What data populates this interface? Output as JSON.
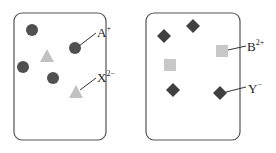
{
  "diagram": {
    "colors": {
      "dark_particle": "#505050",
      "light_particle": "#c2c2c2",
      "border": "#555555",
      "text": "#222222"
    },
    "panels": [
      {
        "id": "left",
        "box": {
          "x": 14,
          "y": 13,
          "w": 92,
          "h": 127,
          "r": 8
        },
        "particles": [
          {
            "type": "circle",
            "species": "A+",
            "x": 32,
            "y": 30
          },
          {
            "type": "circle",
            "species": "A+",
            "x": 75,
            "y": 48
          },
          {
            "type": "circle",
            "species": "A+",
            "x": 23,
            "y": 67
          },
          {
            "type": "circle",
            "species": "A+",
            "x": 53,
            "y": 78
          },
          {
            "type": "triangle",
            "species": "X2-",
            "x": 47,
            "y": 56
          },
          {
            "type": "triangle",
            "species": "X2-",
            "x": 76,
            "y": 92
          }
        ],
        "labels": [
          {
            "base": "A",
            "sup": "+",
            "x": 84,
            "y": 33,
            "line": [
              79,
              46,
              96,
              33
            ]
          },
          {
            "base": "X",
            "sup": "2−",
            "x": 82,
            "y": 78,
            "line": [
              80,
              88,
              96,
              77
            ]
          }
        ]
      },
      {
        "id": "right",
        "box": {
          "x": 146,
          "y": 13,
          "w": 94,
          "h": 127,
          "r": 8
        },
        "particles": [
          {
            "type": "diamond",
            "species": "Y-",
            "x": 164,
            "y": 36
          },
          {
            "type": "diamond",
            "species": "Y-",
            "x": 193,
            "y": 26
          },
          {
            "type": "diamond",
            "species": "Y-",
            "x": 173,
            "y": 90
          },
          {
            "type": "diamond",
            "species": "Y-",
            "x": 220,
            "y": 93
          },
          {
            "type": "square",
            "species": "B2+",
            "x": 222,
            "y": 51
          },
          {
            "type": "square",
            "species": "B2+",
            "x": 170,
            "y": 65
          }
        ],
        "labels": [
          {
            "base": "B",
            "sup": "2+",
            "x": 248,
            "y": 50,
            "line": [
              227,
              50,
              246,
              46
            ]
          },
          {
            "base": "Y",
            "sup": "−",
            "x": 248,
            "y": 94,
            "line": [
              225,
              92,
              246,
              87
            ]
          }
        ]
      }
    ],
    "label_text": {
      "a": {
        "base": "A",
        "sup": "+"
      },
      "x": {
        "base": "X",
        "sup": "2−"
      },
      "b": {
        "base": "B",
        "sup": "2+"
      },
      "y": {
        "base": "Y",
        "sup": "−"
      }
    }
  }
}
